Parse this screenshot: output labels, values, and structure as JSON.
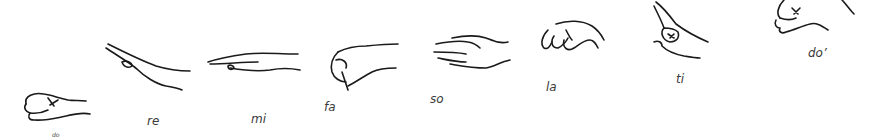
{
  "diagram": {
    "signs": [
      {
        "syllable": "do",
        "label": "do",
        "hand": "fist"
      },
      {
        "syllable": "re",
        "label": "re",
        "hand": "flat-hand-angled-up"
      },
      {
        "syllable": "mi",
        "label": "mi",
        "hand": "flat-hand-horizontal"
      },
      {
        "syllable": "fa",
        "label": "fa",
        "hand": "thumb-pointing-down"
      },
      {
        "syllable": "so",
        "label": "so",
        "hand": "open-palm-facing-body"
      },
      {
        "syllable": "la",
        "label": "la",
        "hand": "relaxed-drooping-hand"
      },
      {
        "syllable": "ti",
        "label": "ti",
        "hand": "index-finger-pointing-up"
      },
      {
        "syllable": "do'",
        "label": "do’",
        "hand": "fist-high"
      }
    ]
  }
}
